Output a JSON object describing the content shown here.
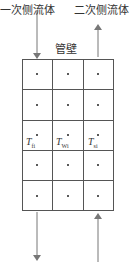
{
  "labels": {
    "primary_fluid": "一次侧流体",
    "secondary_fluid": "二次侧流体",
    "tube_wall": "管壁"
  },
  "grid": {
    "rows": 5,
    "cols": 3,
    "labeled_row": 2
  },
  "temps": [
    {
      "base": "T",
      "sub": "fi"
    },
    {
      "base": "T",
      "sub": "Wi"
    },
    {
      "base": "T",
      "sub": "si"
    }
  ],
  "arrows": {
    "primary": "down",
    "secondary": "up"
  },
  "colors": {
    "line": "#555555",
    "arrow": "#777777"
  }
}
